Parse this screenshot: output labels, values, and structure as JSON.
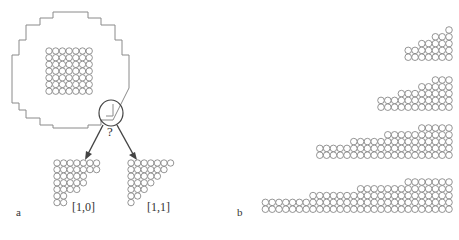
{
  "figure": {
    "panel_a": {
      "label": "a",
      "question_mark": "?",
      "center_grid": {
        "rows": 7,
        "cols": 7,
        "x0": 49,
        "y0": 51,
        "pitch": 6.7,
        "r": 3.2
      },
      "options": [
        {
          "label": "[1,0]",
          "row_counts": [
            7,
            7,
            5,
            5,
            4,
            2,
            2
          ],
          "x0": 57,
          "y0": 163,
          "pitch": 6.6,
          "r": 3.2
        },
        {
          "label": "[1,1]",
          "row_counts": [
            7,
            6,
            5,
            4,
            3,
            2,
            1
          ],
          "x0": 131,
          "y0": 163,
          "pitch": 6.6,
          "r": 3.2
        }
      ]
    },
    "panel_b": {
      "label": "b",
      "staircases": [
        {
          "row_counts": [
            1,
            3,
            5,
            7,
            7
          ],
          "right_x": 449,
          "top_y": 30
        },
        {
          "row_counts": [
            3,
            5,
            8,
            11,
            11
          ],
          "right_x": 449,
          "top_y": 80
        },
        {
          "row_counts": [
            5,
            10,
            15,
            20,
            20
          ],
          "right_x": 449,
          "top_y": 128
        },
        {
          "row_counts": [
            7,
            14,
            21,
            28,
            28
          ],
          "right_x": 449,
          "top_y": 182
        }
      ],
      "pitch": 6.8,
      "r": 3.3
    },
    "colors": {
      "outline": "#8a8a8a",
      "atom_stroke": "#7a7a7a",
      "arrow": "#444444",
      "text": "#333333"
    }
  }
}
